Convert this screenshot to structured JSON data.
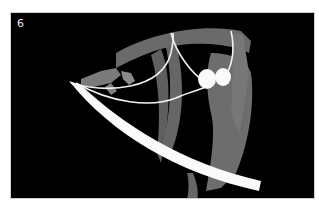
{
  "figure": {
    "panel_label": "6",
    "colors": {
      "background": "#000000",
      "muscle_grey": "#6e6e6e",
      "muscle_dark": "#5a5a5a",
      "nerve_white": "#f2f2f2",
      "band_white": "#fafafa",
      "frame_border": "#cfcfcf"
    }
  }
}
